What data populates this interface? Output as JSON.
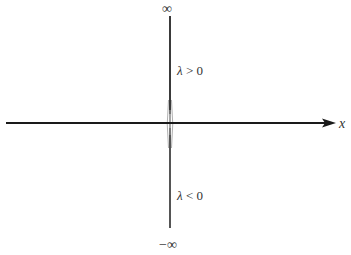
{
  "figure": {
    "axis": {
      "label": "x"
    },
    "labels": {
      "top": "∞",
      "bottom": "−∞",
      "positive_region": {
        "symbol": "λ",
        "relation": " > 0"
      },
      "negative_region": {
        "symbol": "λ",
        "relation": " < 0"
      }
    },
    "colors": {
      "axis": "#1a1a1a",
      "spike_dark": "#2a2a2a",
      "spike_light": "#9a9a9a",
      "text": "#333333"
    }
  }
}
